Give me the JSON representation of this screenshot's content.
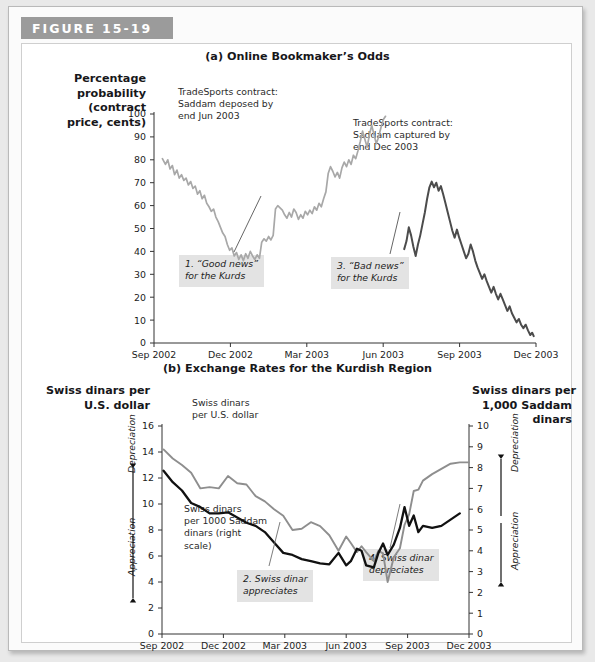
{
  "figure": {
    "tab_label": "FIGURE 15-19"
  },
  "panel_a": {
    "title": "(a) Online Bookmaker’s Odds",
    "y_axis_title": "Percentage\nprobability\n(contract\nprice, cents)",
    "annotation_1": "TradeSports contract:\nSaddam deposed by\nend Jun 2003",
    "annotation_2": "TradeSports contract:\nSaddam captured by\nend Dec 2003",
    "callout_1": "1. “Good news”\nfor the Kurds",
    "callout_3": "3. “Bad news”\nfor the Kurds"
  },
  "panel_b": {
    "title": "(b) Exchange Rates for the Kurdish Region",
    "left_axis_title": "Swiss dinars per\nU.S. dollar",
    "right_axis_title": "Swiss dinars per\n1,000 Saddam\ndinars",
    "left_depreciation": "Depreciation",
    "left_appreciation": "Appreciation",
    "right_depreciation": "Depreciation",
    "right_appreciation": "Appreciation",
    "series_label_1": "Swiss dinars\nper U.S. dollar",
    "series_label_2": "Swiss dinars\nper 1000 Saddam\ndinars (right\nscale)",
    "callout_2": "2. Swiss dinar\nappreciates",
    "callout_4": "4. Swiss dinar\ndepreciates"
  },
  "chart_data": [
    {
      "type": "line",
      "id": "panel-a",
      "title": "(a) Online Bookmaker’s Odds",
      "xlabel": "",
      "ylabel": "Percentage probability (contract price, cents)",
      "ylim": [
        0,
        100
      ],
      "yticks": [
        0,
        10,
        20,
        30,
        40,
        50,
        60,
        70,
        80,
        90,
        100
      ],
      "x_tick_labels": [
        "Sep 2002",
        "Dec 2002",
        "Mar 2003",
        "Jun 2003",
        "Sep 2003",
        "Dec 2003"
      ],
      "x_tick_positions": [
        0,
        0.2,
        0.4,
        0.6,
        0.8,
        1.0
      ],
      "grid": false,
      "legend": "none",
      "series": [
        {
          "name": "TradeSports contract: Saddam deposed by end Jun 2003",
          "color": "#a8a8a8",
          "points": [
            [
              0.022,
              80.5
            ],
            [
              0.03,
              78.0
            ],
            [
              0.036,
              80.0
            ],
            [
              0.042,
              76.0
            ],
            [
              0.048,
              77.5
            ],
            [
              0.054,
              73.5
            ],
            [
              0.06,
              75.5
            ],
            [
              0.066,
              72.0
            ],
            [
              0.072,
              73.5
            ],
            [
              0.078,
              71.0
            ],
            [
              0.084,
              72.0
            ],
            [
              0.09,
              69.0
            ],
            [
              0.096,
              70.5
            ],
            [
              0.102,
              67.5
            ],
            [
              0.108,
              68.5
            ],
            [
              0.114,
              65.0
            ],
            [
              0.12,
              66.5
            ],
            [
              0.126,
              63.0
            ],
            [
              0.132,
              64.5
            ],
            [
              0.138,
              61.0
            ],
            [
              0.144,
              59.5
            ],
            [
              0.15,
              57.5
            ],
            [
              0.156,
              58.5
            ],
            [
              0.162,
              55.0
            ],
            [
              0.168,
              53.0
            ],
            [
              0.174,
              50.5
            ],
            [
              0.18,
              48.0
            ],
            [
              0.186,
              46.5
            ],
            [
              0.192,
              43.0
            ],
            [
              0.198,
              40.5
            ],
            [
              0.204,
              41.5
            ],
            [
              0.21,
              38.0
            ],
            [
              0.216,
              39.5
            ],
            [
              0.222,
              36.5
            ],
            [
              0.228,
              38.5
            ],
            [
              0.234,
              36.0
            ],
            [
              0.24,
              39.0
            ],
            [
              0.246,
              37.0
            ],
            [
              0.252,
              40.0
            ],
            [
              0.258,
              38.0
            ],
            [
              0.264,
              36.5
            ],
            [
              0.27,
              38.5
            ],
            [
              0.276,
              37.0
            ],
            [
              0.282,
              44.0
            ],
            [
              0.288,
              45.5
            ],
            [
              0.294,
              44.5
            ],
            [
              0.3,
              46.5
            ],
            [
              0.306,
              45.0
            ],
            [
              0.312,
              47.0
            ],
            [
              0.318,
              58.5
            ],
            [
              0.324,
              60.0
            ],
            [
              0.33,
              59.0
            ],
            [
              0.336,
              58.0
            ],
            [
              0.342,
              56.0
            ],
            [
              0.348,
              54.5
            ],
            [
              0.354,
              57.0
            ],
            [
              0.36,
              55.0
            ],
            [
              0.366,
              58.5
            ],
            [
              0.372,
              57.0
            ],
            [
              0.378,
              54.0
            ],
            [
              0.384,
              56.0
            ],
            [
              0.39,
              54.5
            ],
            [
              0.396,
              57.5
            ],
            [
              0.402,
              56.0
            ],
            [
              0.408,
              58.0
            ],
            [
              0.414,
              56.5
            ],
            [
              0.42,
              59.5
            ],
            [
              0.426,
              58.0
            ],
            [
              0.432,
              61.0
            ],
            [
              0.438,
              59.5
            ],
            [
              0.444,
              63.0
            ],
            [
              0.45,
              66.0
            ],
            [
              0.456,
              74.0
            ],
            [
              0.462,
              77.0
            ],
            [
              0.468,
              75.0
            ],
            [
              0.474,
              72.5
            ],
            [
              0.48,
              74.5
            ],
            [
              0.486,
              72.0
            ],
            [
              0.492,
              76.5
            ],
            [
              0.498,
              79.0
            ],
            [
              0.504,
              77.0
            ],
            [
              0.51,
              80.0
            ],
            [
              0.516,
              78.0
            ],
            [
              0.522,
              82.0
            ],
            [
              0.528,
              80.5
            ],
            [
              0.534,
              84.0
            ],
            [
              0.54,
              88.0
            ],
            [
              0.546,
              92.5
            ],
            [
              0.552,
              89.0
            ],
            [
              0.558,
              85.5
            ],
            [
              0.564,
              91.0
            ],
            [
              0.57,
              95.0
            ],
            [
              0.576,
              91.0
            ],
            [
              0.582,
              87.0
            ],
            [
              0.588,
              90.0
            ],
            [
              0.594,
              94.0
            ],
            [
              0.6,
              97.5
            ],
            [
              0.606,
              99.0
            ]
          ]
        },
        {
          "name": "TradeSports contract: Saddam captured by end Dec 2003",
          "color": "#4c4c4c",
          "points": [
            [
              0.655,
              41.0
            ],
            [
              0.661,
              44.5
            ],
            [
              0.667,
              50.5
            ],
            [
              0.673,
              47.0
            ],
            [
              0.679,
              42.0
            ],
            [
              0.685,
              38.0
            ],
            [
              0.691,
              43.0
            ],
            [
              0.697,
              47.0
            ],
            [
              0.703,
              52.0
            ],
            [
              0.709,
              57.0
            ],
            [
              0.715,
              63.0
            ],
            [
              0.721,
              68.0
            ],
            [
              0.727,
              70.5
            ],
            [
              0.733,
              68.0
            ],
            [
              0.739,
              70.0
            ],
            [
              0.745,
              66.5
            ],
            [
              0.751,
              68.5
            ],
            [
              0.757,
              65.0
            ],
            [
              0.763,
              61.0
            ],
            [
              0.769,
              57.0
            ],
            [
              0.775,
              53.0
            ],
            [
              0.781,
              49.0
            ],
            [
              0.787,
              46.0
            ],
            [
              0.793,
              49.5
            ],
            [
              0.799,
              46.0
            ],
            [
              0.805,
              43.0
            ],
            [
              0.811,
              40.0
            ],
            [
              0.817,
              37.0
            ],
            [
              0.823,
              39.0
            ],
            [
              0.829,
              43.0
            ],
            [
              0.835,
              40.0
            ],
            [
              0.841,
              36.0
            ],
            [
              0.847,
              33.0
            ],
            [
              0.853,
              30.5
            ],
            [
              0.859,
              28.0
            ],
            [
              0.865,
              30.0
            ],
            [
              0.871,
              27.0
            ],
            [
              0.877,
              24.5
            ],
            [
              0.883,
              22.0
            ],
            [
              0.889,
              24.5
            ],
            [
              0.895,
              21.5
            ],
            [
              0.901,
              19.0
            ],
            [
              0.907,
              21.5
            ],
            [
              0.913,
              19.0
            ],
            [
              0.919,
              16.5
            ],
            [
              0.925,
              14.0
            ],
            [
              0.931,
              16.0
            ],
            [
              0.937,
              13.0
            ],
            [
              0.943,
              11.0
            ],
            [
              0.949,
              9.0
            ],
            [
              0.955,
              10.5
            ],
            [
              0.961,
              8.0
            ],
            [
              0.967,
              6.5
            ],
            [
              0.973,
              8.0
            ],
            [
              0.979,
              5.5
            ],
            [
              0.985,
              3.5
            ],
            [
              0.99,
              4.5
            ],
            [
              0.994,
              3.0
            ]
          ]
        }
      ]
    },
    {
      "type": "line",
      "id": "panel-b",
      "title": "(b) Exchange Rates for the Kurdish Region",
      "xlabel": "",
      "ylabel": "Swiss dinars per U.S. dollar",
      "ylabel_right": "Swiss dinars per 1,000 Saddam dinars",
      "ylim": [
        0,
        16
      ],
      "yticks": [
        0,
        2,
        4,
        6,
        8,
        10,
        12,
        14,
        16
      ],
      "ylim_right": [
        0,
        10
      ],
      "yticks_right": [
        0,
        1,
        2,
        3,
        4,
        5,
        6,
        7,
        8,
        9,
        10
      ],
      "x_tick_labels": [
        "Sep 2002",
        "Dec 2002",
        "Mar 2003",
        "Jun 2003",
        "Sep 2003",
        "Dec 2003"
      ],
      "x_tick_positions": [
        0,
        0.2,
        0.4,
        0.6,
        0.8,
        1.0
      ],
      "grid": false,
      "legend": "inline-labels",
      "series": [
        {
          "name": "Swiss dinars per U.S. dollar",
          "axis": "left",
          "color": "#8e8e8e",
          "points": [
            [
              0.005,
              14.2
            ],
            [
              0.035,
              13.5
            ],
            [
              0.065,
              13.0
            ],
            [
              0.095,
              12.4
            ],
            [
              0.125,
              11.2
            ],
            [
              0.155,
              11.3
            ],
            [
              0.185,
              11.2
            ],
            [
              0.215,
              12.15
            ],
            [
              0.245,
              11.6
            ],
            [
              0.275,
              11.5
            ],
            [
              0.305,
              10.6
            ],
            [
              0.335,
              10.2
            ],
            [
              0.365,
              9.6
            ],
            [
              0.395,
              9.1
            ],
            [
              0.425,
              8.0
            ],
            [
              0.455,
              8.1
            ],
            [
              0.485,
              8.6
            ],
            [
              0.515,
              8.3
            ],
            [
              0.545,
              7.6
            ],
            [
              0.575,
              6.4
            ],
            [
              0.6,
              7.5
            ],
            [
              0.615,
              7.0
            ],
            [
              0.635,
              6.3
            ],
            [
              0.65,
              6.75
            ],
            [
              0.665,
              6.3
            ],
            [
              0.69,
              5.6
            ],
            [
              0.705,
              6.4
            ],
            [
              0.72,
              6.2
            ],
            [
              0.735,
              4.0
            ],
            [
              0.755,
              5.9
            ],
            [
              0.775,
              6.6
            ],
            [
              0.79,
              8.4
            ],
            [
              0.805,
              9.2
            ],
            [
              0.82,
              11.0
            ],
            [
              0.835,
              11.1
            ],
            [
              0.85,
              11.8
            ],
            [
              0.88,
              12.3
            ],
            [
              0.91,
              12.7
            ],
            [
              0.94,
              13.1
            ],
            [
              0.97,
              13.2
            ],
            [
              1.0,
              13.2
            ]
          ]
        },
        {
          "name": "Swiss dinars per 1000 Saddam dinars (right scale)",
          "axis": "right",
          "color": "#111111",
          "points": [
            [
              0.005,
              7.85
            ],
            [
              0.035,
              7.3
            ],
            [
              0.065,
              6.9
            ],
            [
              0.095,
              6.3
            ],
            [
              0.125,
              6.1
            ],
            [
              0.155,
              5.8
            ],
            [
              0.185,
              5.8
            ],
            [
              0.215,
              5.85
            ],
            [
              0.245,
              5.6
            ],
            [
              0.275,
              5.35
            ],
            [
              0.305,
              5.2
            ],
            [
              0.335,
              4.9
            ],
            [
              0.365,
              4.4
            ],
            [
              0.395,
              3.9
            ],
            [
              0.425,
              3.8
            ],
            [
              0.455,
              3.6
            ],
            [
              0.485,
              3.5
            ],
            [
              0.515,
              3.4
            ],
            [
              0.545,
              3.35
            ],
            [
              0.575,
              3.9
            ],
            [
              0.6,
              3.3
            ],
            [
              0.615,
              3.5
            ],
            [
              0.635,
              4.1
            ],
            [
              0.65,
              4.0
            ],
            [
              0.665,
              3.3
            ],
            [
              0.69,
              3.2
            ],
            [
              0.705,
              3.9
            ],
            [
              0.72,
              4.35
            ],
            [
              0.735,
              3.8
            ],
            [
              0.755,
              4.3
            ],
            [
              0.775,
              5.1
            ],
            [
              0.79,
              6.1
            ],
            [
              0.805,
              5.2
            ],
            [
              0.82,
              5.7
            ],
            [
              0.835,
              4.9
            ],
            [
              0.85,
              5.2
            ],
            [
              0.88,
              5.1
            ],
            [
              0.91,
              5.2
            ],
            [
              0.94,
              5.5
            ],
            [
              0.97,
              5.8
            ]
          ]
        }
      ]
    }
  ]
}
